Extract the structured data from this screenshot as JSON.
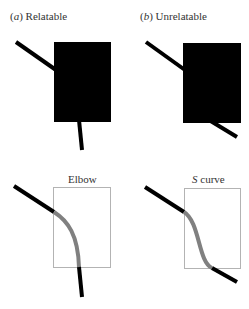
{
  "panels": [
    {
      "letter": "(a)",
      "title": "Relatable"
    },
    {
      "letter": "(b)",
      "title": "Unrelatable"
    }
  ],
  "curves": [
    {
      "title": "Elbow"
    },
    {
      "title": "S curve"
    }
  ],
  "colors": {
    "occluder": "#000000",
    "line": "#000000",
    "interpolated": "#808080",
    "box": "#b3b3b3"
  }
}
